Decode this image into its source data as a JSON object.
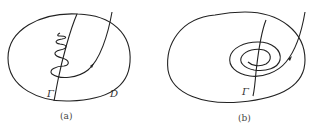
{
  "figures": [
    {
      "id": "a",
      "caption": "(a)",
      "labels": {
        "curve": "Γ",
        "region": "D"
      },
      "description": "Closed region D containing curve Γ; a trajectory enters from top right, arrow pointing along it, then oscillates/winds back and forth around Γ"
    },
    {
      "id": "b",
      "caption": "(b)",
      "labels": {
        "curve": "Γ"
      },
      "description": "Closed region with curve Γ; a trajectory enters from top right with arrow and spirals inward around Γ"
    }
  ]
}
